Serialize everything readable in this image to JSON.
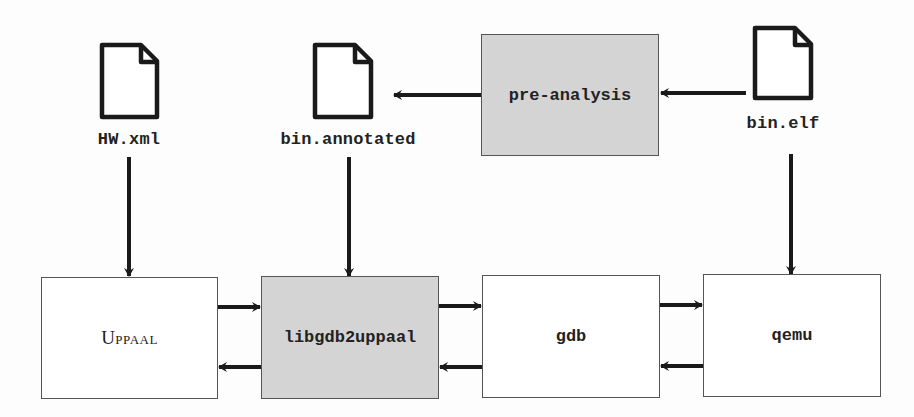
{
  "files": {
    "hw_xml": {
      "label": "HW.xml",
      "icon": "file-icon"
    },
    "bin_annotated": {
      "label": "bin.annotated",
      "icon": "file-icon"
    },
    "bin_elf": {
      "label": "bin.elf",
      "icon": "file-icon"
    }
  },
  "components": {
    "pre_analysis": {
      "label": "pre-analysis",
      "fill": "#d4d4d4"
    },
    "uppaal": {
      "label": "Uppaal",
      "fill": "#ffffff"
    },
    "libgdb2uppaal": {
      "label": "libgdb2uppaal",
      "fill": "#d4d4d4"
    },
    "gdb": {
      "label": "gdb",
      "fill": "#ffffff"
    },
    "qemu": {
      "label": "qemu",
      "fill": "#ffffff"
    }
  },
  "edges": [
    {
      "from": "bin.elf",
      "to": "pre-analysis"
    },
    {
      "from": "pre-analysis",
      "to": "bin.annotated"
    },
    {
      "from": "HW.xml",
      "to": "Uppaal"
    },
    {
      "from": "bin.annotated",
      "to": "libgdb2uppaal"
    },
    {
      "from": "bin.elf",
      "to": "qemu"
    },
    {
      "from": "Uppaal",
      "to": "libgdb2uppaal"
    },
    {
      "from": "libgdb2uppaal",
      "to": "Uppaal"
    },
    {
      "from": "libgdb2uppaal",
      "to": "gdb"
    },
    {
      "from": "gdb",
      "to": "libgdb2uppaal"
    },
    {
      "from": "gdb",
      "to": "qemu"
    },
    {
      "from": "qemu",
      "to": "gdb"
    }
  ]
}
